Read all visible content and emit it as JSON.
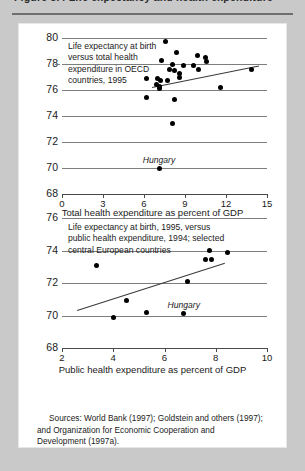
{
  "figure": {
    "title_partial": "Figure 3.4  Life expectancy and health expenditure",
    "sources_label": "Sources:",
    "sources_text": "World Bank (1997); Goldstein and others (1997); and Organization for Economic Cooperation and Development (1997a)."
  },
  "chart_data": [
    {
      "type": "scatter",
      "title": "Life expectancy at birth versus total health expenditure in OECD countries, 1995",
      "xlabel": "Total health expenditure as percent of GDP",
      "ylabel": "",
      "xlim": [
        0,
        15
      ],
      "ylim": [
        68,
        80
      ],
      "xticks": [
        0,
        3,
        6,
        9,
        12,
        15
      ],
      "yticks": [
        68,
        70,
        72,
        74,
        76,
        78,
        80
      ],
      "xtick_labels": [
        "0",
        "3",
        "6",
        "9",
        "12",
        "15"
      ],
      "ytick_labels": [
        "68",
        "70",
        "72",
        "74",
        "76",
        "78",
        "80"
      ],
      "grid": true,
      "legend": "none",
      "annotations": [
        {
          "text": "Hungary",
          "x": 7.1,
          "y": 70.55
        }
      ],
      "points": [
        {
          "x": 7.6,
          "y": 79.75
        },
        {
          "x": 8.4,
          "y": 78.85
        },
        {
          "x": 9.9,
          "y": 78.65
        },
        {
          "x": 7.3,
          "y": 78.3
        },
        {
          "x": 10.5,
          "y": 78.5
        },
        {
          "x": 10.6,
          "y": 78.2
        },
        {
          "x": 8.1,
          "y": 77.95
        },
        {
          "x": 8.9,
          "y": 77.9
        },
        {
          "x": 9.6,
          "y": 77.85
        },
        {
          "x": 10.0,
          "y": 77.6
        },
        {
          "x": 7.9,
          "y": 77.55
        },
        {
          "x": 8.2,
          "y": 77.5
        },
        {
          "x": 8.6,
          "y": 77.3
        },
        {
          "x": 13.9,
          "y": 77.55
        },
        {
          "x": 8.6,
          "y": 77.0
        },
        {
          "x": 6.2,
          "y": 76.85
        },
        {
          "x": 7.0,
          "y": 76.85
        },
        {
          "x": 7.2,
          "y": 76.7
        },
        {
          "x": 7.7,
          "y": 76.7
        },
        {
          "x": 6.9,
          "y": 76.45
        },
        {
          "x": 7.1,
          "y": 76.3
        },
        {
          "x": 7.1,
          "y": 76.1
        },
        {
          "x": 11.6,
          "y": 76.2
        },
        {
          "x": 6.2,
          "y": 75.4
        },
        {
          "x": 8.2,
          "y": 75.3
        },
        {
          "x": 8.1,
          "y": 73.4
        },
        {
          "x": 7.1,
          "y": 70.0
        }
      ],
      "trendline": {
        "x1": 6.6,
        "y1": 76.2,
        "x2": 14.4,
        "y2": 77.85
      }
    },
    {
      "type": "scatter",
      "title": "Life expectancy at birth, 1995, versus public health expenditure, 1994; selected central European countries",
      "xlabel": "Public health expenditure as percent of GDP",
      "ylabel": "",
      "xlim": [
        2,
        10
      ],
      "ylim": [
        68,
        76
      ],
      "xticks": [
        2,
        4,
        6,
        8,
        10
      ],
      "yticks": [
        68,
        70,
        72,
        74,
        76
      ],
      "xtick_labels": [
        "2",
        "4",
        "6",
        "8",
        "10"
      ],
      "ytick_labels": [
        "68",
        "70",
        "72",
        "74",
        "76"
      ],
      "grid": true,
      "legend": "none",
      "annotations": [
        {
          "text": "Hungary",
          "x": 6.75,
          "y": 70.6
        }
      ],
      "points": [
        {
          "x": 7.75,
          "y": 74.0
        },
        {
          "x": 8.45,
          "y": 73.9
        },
        {
          "x": 7.6,
          "y": 73.45
        },
        {
          "x": 7.85,
          "y": 73.45
        },
        {
          "x": 3.35,
          "y": 73.1
        },
        {
          "x": 6.9,
          "y": 72.1
        },
        {
          "x": 4.5,
          "y": 70.95
        },
        {
          "x": 5.3,
          "y": 70.2
        },
        {
          "x": 6.75,
          "y": 70.1
        },
        {
          "x": 4.0,
          "y": 69.9
        }
      ],
      "trendline": {
        "x1": 2.6,
        "y1": 70.35,
        "x2": 8.35,
        "y2": 73.25
      }
    }
  ]
}
